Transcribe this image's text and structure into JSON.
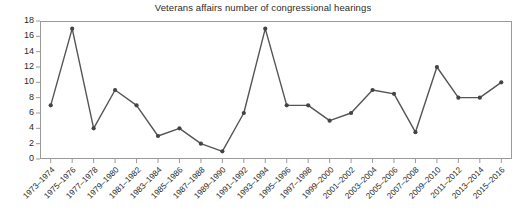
{
  "chart_data": {
    "type": "line",
    "title": "Veterans affairs number of congressional hearings",
    "xlabel": "",
    "ylabel": "",
    "ylim": [
      0,
      18
    ],
    "yticks": [
      0,
      2,
      4,
      6,
      8,
      10,
      12,
      14,
      16,
      18
    ],
    "grid": false,
    "legend": "none",
    "marker": "circle",
    "line_color": "#555555",
    "marker_color": "#444444",
    "frame_color": "#9a9a9a",
    "categories": [
      "1973–1974",
      "1975–1976",
      "1977–1978",
      "1979–1980",
      "1981–1982",
      "1983–1984",
      "1985–1986",
      "1987–1988",
      "1989–1990",
      "1991–1992",
      "1993–1994",
      "1995–1996",
      "1997–1998",
      "1999–2000",
      "2001–2002",
      "2003–2004",
      "2005–2006",
      "2007–2008",
      "2009–2010",
      "2011–2012",
      "2013–2014",
      "2015–2016"
    ],
    "values": [
      7,
      17,
      4,
      9,
      7,
      3,
      4,
      2,
      1,
      6,
      17,
      7,
      7,
      5,
      6,
      9,
      8.5,
      3.5,
      12,
      8,
      8,
      10
    ]
  }
}
